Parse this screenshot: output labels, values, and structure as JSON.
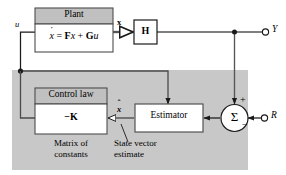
{
  "diagram": {
    "background_color": "#ffffff",
    "line_color": "#1a1a1a",
    "shade_color": "#c8c8c8",
    "header_fill": "#c0c0c0",
    "block_fill": "#ffffff",
    "border_color": "#4d4d4d"
  },
  "plant": {
    "title": "Plant",
    "equation": {
      "state_derivative": "x",
      "derivative_mark": "˙",
      "equals": "=",
      "term_f": "F",
      "term_x": "x",
      "plus": "+",
      "term_g": "G",
      "term_u": "u",
      "plain": "ẋ = Fx + Gu"
    }
  },
  "control_law": {
    "title": "Control law",
    "body": "−K",
    "minus": "−",
    "gain": "K",
    "caption_line1": "Matrix of",
    "caption_line2": "constants"
  },
  "estimator": {
    "label": "Estimator",
    "caption_line1": "State vector",
    "caption_line2": "estimate"
  },
  "output_gain": {
    "label": "H"
  },
  "summer": {
    "symbol": "Σ",
    "sign_top": "+",
    "sign_right": "−"
  },
  "signals": {
    "control_input": "u",
    "state": "x",
    "state_estimate": "x",
    "state_estimate_hat": "ˆ",
    "state_estimate_plain": "x̂",
    "output_terminal": "Y",
    "reference_terminal": "R"
  }
}
